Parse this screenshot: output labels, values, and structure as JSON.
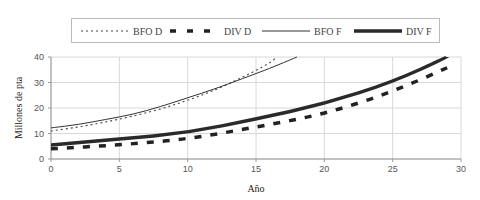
{
  "chart_data": {
    "type": "line",
    "title": "",
    "xlabel": "Año",
    "ylabel": "Millones de pta",
    "xlim": [
      0,
      30
    ],
    "ylim": [
      0,
      40
    ],
    "xticks": [
      0,
      5,
      10,
      15,
      20,
      25,
      30
    ],
    "yticks": [
      0,
      10,
      20,
      30,
      40
    ],
    "grid": true,
    "legend_position": "top",
    "series": [
      {
        "name": "BFO D",
        "style": "dotted-thin",
        "x": [
          0,
          2,
          4,
          6,
          8,
          10,
          12,
          14,
          16,
          16.5
        ],
        "y": [
          11,
          12.5,
          14.5,
          16.8,
          19.5,
          23,
          27,
          32,
          37.5,
          40
        ]
      },
      {
        "name": "DIV D",
        "style": "dashed-thick",
        "x": [
          0,
          5,
          10,
          15,
          20,
          25,
          29.5
        ],
        "y": [
          4,
          5.5,
          7.8,
          12.5,
          17.6,
          26.3,
          37
        ]
      },
      {
        "name": "BFO F",
        "style": "solid-thin",
        "x": [
          0,
          2,
          4,
          6,
          8,
          10,
          12,
          14,
          16,
          18
        ],
        "y": [
          12.2,
          13.5,
          15.5,
          17.5,
          20.5,
          24,
          27.5,
          31.5,
          35.5,
          40
        ]
      },
      {
        "name": "DIV F",
        "style": "solid-thick",
        "x": [
          0,
          5,
          10,
          15,
          20,
          25,
          29
        ],
        "y": [
          5.5,
          7.8,
          10.3,
          15.7,
          21.6,
          30.2,
          40
        ]
      }
    ]
  },
  "legend": {
    "items": [
      "BFO D",
      "DIV D",
      "BFO F",
      "DIV F"
    ]
  },
  "axes": {
    "x_title": "Año",
    "y_title": "Millones de pta",
    "x_ticks": [
      "0",
      "5",
      "10",
      "15",
      "20",
      "25",
      "30"
    ],
    "y_ticks": [
      "0",
      "10",
      "20",
      "30",
      "40"
    ]
  }
}
